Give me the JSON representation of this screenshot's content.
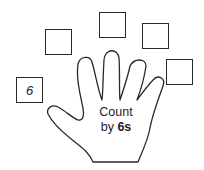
{
  "worksheet": {
    "title_line1": "Count",
    "title_line2_prefix": "by ",
    "title_line2_bold": "6s",
    "boxes": [
      {
        "value": "6"
      },
      {
        "value": ""
      },
      {
        "value": ""
      },
      {
        "value": ""
      },
      {
        "value": ""
      }
    ]
  },
  "colors": {
    "stroke": "#2a2a2a",
    "background": "#ffffff"
  }
}
